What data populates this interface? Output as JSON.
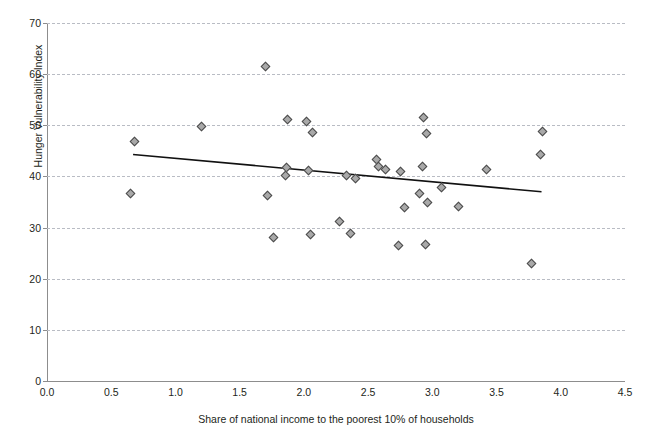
{
  "chart_data": {
    "type": "scatter",
    "title": "",
    "xlabel": "Share of national income to the poorest 10% of households",
    "ylabel": "Hunger Vulnerability Index",
    "xlim": [
      0.0,
      4.5
    ],
    "ylim": [
      0,
      70
    ],
    "xticks": [
      "0.0",
      "0.5",
      "1.0",
      "1.5",
      "2.0",
      "2.5",
      "3.0",
      "3.5",
      "4.0",
      "4.5"
    ],
    "yticks": [
      "0",
      "10",
      "20",
      "30",
      "40",
      "50",
      "60",
      "70"
    ],
    "grid": "horizontal-dashed",
    "legend": "none",
    "marker": "diamond",
    "marker_color": "#a9a9a9",
    "marker_edge_color": "#4b4b4b",
    "trendline_color": "#111111",
    "points": [
      {
        "x": 0.68,
        "y": 47.0
      },
      {
        "x": 0.65,
        "y": 36.8
      },
      {
        "x": 1.2,
        "y": 49.9
      },
      {
        "x": 1.7,
        "y": 61.5
      },
      {
        "x": 1.71,
        "y": 36.3
      },
      {
        "x": 1.76,
        "y": 28.2
      },
      {
        "x": 1.87,
        "y": 51.2
      },
      {
        "x": 1.86,
        "y": 41.9
      },
      {
        "x": 1.85,
        "y": 40.3
      },
      {
        "x": 2.02,
        "y": 50.9
      },
      {
        "x": 2.06,
        "y": 48.7
      },
      {
        "x": 2.03,
        "y": 41.2
      },
      {
        "x": 2.05,
        "y": 28.8
      },
      {
        "x": 2.27,
        "y": 31.2
      },
      {
        "x": 2.33,
        "y": 40.2
      },
      {
        "x": 2.4,
        "y": 39.7
      },
      {
        "x": 2.36,
        "y": 28.9
      },
      {
        "x": 2.56,
        "y": 43.4
      },
      {
        "x": 2.58,
        "y": 42.1
      },
      {
        "x": 2.63,
        "y": 41.5
      },
      {
        "x": 2.75,
        "y": 41.0
      },
      {
        "x": 2.78,
        "y": 34.0
      },
      {
        "x": 2.73,
        "y": 26.5
      },
      {
        "x": 2.93,
        "y": 51.7
      },
      {
        "x": 2.95,
        "y": 48.5
      },
      {
        "x": 2.92,
        "y": 42.0
      },
      {
        "x": 2.9,
        "y": 36.7
      },
      {
        "x": 2.96,
        "y": 35.0
      },
      {
        "x": 2.94,
        "y": 26.7
      },
      {
        "x": 3.07,
        "y": 37.9
      },
      {
        "x": 3.2,
        "y": 34.2
      },
      {
        "x": 3.42,
        "y": 41.4
      },
      {
        "x": 3.77,
        "y": 23.0
      },
      {
        "x": 3.85,
        "y": 48.8
      },
      {
        "x": 3.84,
        "y": 44.3
      }
    ],
    "trendline": {
      "x0": 0.67,
      "y0": 44.3,
      "x1": 3.85,
      "y1": 37.0
    }
  }
}
